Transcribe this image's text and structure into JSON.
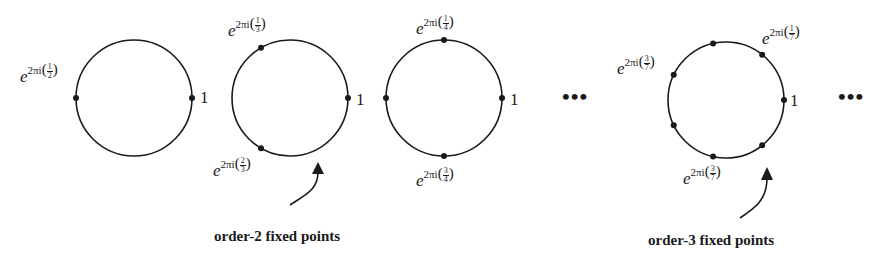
{
  "diagram": {
    "stroke_color": "#1a1a1a",
    "circles": [
      {
        "id": "order-2",
        "n": 2,
        "cx": 134,
        "cy": 98,
        "r": 58,
        "points_deg": [
          0,
          180
        ],
        "one_label": "1",
        "labels": [
          {
            "base": "e",
            "exp": "2πi",
            "num": "1",
            "den": "2",
            "pos": "left"
          }
        ]
      },
      {
        "id": "order-3",
        "n": 3,
        "cx": 290,
        "cy": 98,
        "r": 58,
        "points_deg": [
          0,
          120,
          240
        ],
        "one_label": "1",
        "labels": [
          {
            "base": "e",
            "exp": "2πi",
            "num": "1",
            "den": "3",
            "pos": "top-left"
          },
          {
            "base": "e",
            "exp": "2πi",
            "num": "2",
            "den": "3",
            "pos": "bottom-left"
          }
        ]
      },
      {
        "id": "order-4",
        "n": 4,
        "cx": 444,
        "cy": 98,
        "r": 58,
        "points_deg": [
          0,
          90,
          180,
          270
        ],
        "one_label": "1",
        "labels": [
          {
            "base": "e",
            "exp": "2πi",
            "num": "1",
            "den": "4",
            "pos": "top"
          },
          {
            "base": "e",
            "exp": "2πi",
            "num": "3",
            "den": "4",
            "pos": "bottom"
          }
        ]
      },
      {
        "id": "order-7",
        "n": 7,
        "cx": 726,
        "cy": 100,
        "r": 58,
        "points_deg": [
          0,
          51.43,
          102.86,
          154.29,
          205.71,
          257.14,
          308.57
        ],
        "one_label": "1",
        "labels": [
          {
            "base": "e",
            "exp": "2πi",
            "num": "1",
            "den": "7",
            "pos": "top-right"
          },
          {
            "base": "e",
            "exp": "2πi",
            "num": "3",
            "den": "7",
            "pos": "left"
          },
          {
            "base": "e",
            "exp": "2πi",
            "num": "3",
            "den": "7",
            "pos": "bottom"
          }
        ]
      }
    ],
    "ellipsis": [
      "•••",
      "•••"
    ],
    "captions": [
      {
        "text": "order-2 fixed points",
        "points_to": "order-3"
      },
      {
        "text": "order-3 fixed points",
        "points_to": "order-7"
      }
    ]
  }
}
